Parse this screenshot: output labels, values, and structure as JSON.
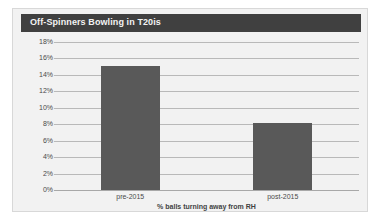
{
  "chart_data": {
    "type": "bar",
    "title": "Off-Spinners Bowling in T20is",
    "categories": [
      "pre-2015",
      "post-2015"
    ],
    "values": [
      15.1,
      8.2
    ],
    "xlabel": "% balls turning away from RH",
    "ylabel": "",
    "ylim": [
      0,
      18
    ],
    "ytick_step": 2,
    "ytick_labels": [
      "18%",
      "16%",
      "14%",
      "12%",
      "10%",
      "8%",
      "6%",
      "4%",
      "2%",
      "0%"
    ],
    "ytick_values": [
      18,
      16,
      14,
      12,
      10,
      8,
      6,
      4,
      2,
      0
    ],
    "grid": true,
    "legend": false,
    "legend_position": "none",
    "colors": {
      "bar": "#595959",
      "title_band": "#404040",
      "title_text": "#f3f3f3",
      "plot_background": "#f2f2f2",
      "gridline": "#b9b9b9",
      "tick_text": "#4a4a4a"
    }
  }
}
